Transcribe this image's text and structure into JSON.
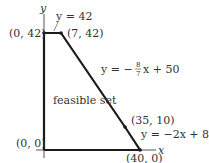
{
  "diagram": {
    "axes": {
      "x_label": "x",
      "y_label": "y"
    },
    "region_label": "feasible set",
    "vertices": [
      {
        "label": "(0, 42)"
      },
      {
        "label": "(7, 42)"
      },
      {
        "label": "(35, 10)"
      },
      {
        "label": "(40, 0)"
      },
      {
        "label": "(0, 0)"
      }
    ],
    "constraints": [
      {
        "label": "y = 42"
      },
      {
        "label_prefix": "y = −",
        "frac_num": "8",
        "frac_den": "7",
        "label_suffix": "x + 50"
      },
      {
        "label": "y = −2x + 80"
      }
    ],
    "colors": {
      "line": "#1a1a1a",
      "axis": "#555555",
      "text": "#333333"
    }
  }
}
